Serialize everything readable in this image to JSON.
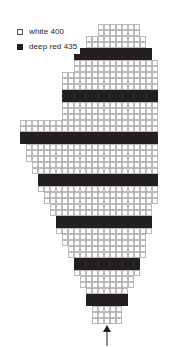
{
  "legend": {
    "items": [
      {
        "swatch": "white-swatch-icon",
        "label": "white 400",
        "color": "#ffffff",
        "kind": "white"
      },
      {
        "swatch": "deep-red-swatch-icon",
        "label": "deep red 435",
        "color": "#231f20",
        "kind": "red"
      }
    ]
  },
  "chart_data": {
    "type": "heatmap",
    "title": "",
    "xlabel": "",
    "ylabel": "",
    "grid": true,
    "legend_position": "top-left",
    "cell_size": 6,
    "origin": {
      "x": 20,
      "y": 24
    },
    "colors": {
      "white": "#ffffff",
      "red": "#231f20",
      "gridline": "#b9b9b9"
    },
    "categories": [
      "white 400",
      "deep red 435"
    ],
    "values": [
      3,
      11
    ],
    "rows": [
      {
        "index": 1,
        "start": 13,
        "count": 7,
        "color": "white"
      },
      {
        "index": 2,
        "start": 13,
        "count": 7,
        "color": "white"
      },
      {
        "index": 3,
        "start": 11,
        "count": 10,
        "color": "white"
      },
      {
        "index": 4,
        "start": 11,
        "count": 10,
        "color": "white"
      },
      {
        "index": 5,
        "start": 10,
        "count": 12,
        "color": "red"
      },
      {
        "index": 6,
        "start": 9,
        "count": 13,
        "color": "red"
      },
      {
        "index": 7,
        "start": 9,
        "count": 14,
        "color": "white"
      },
      {
        "index": 8,
        "start": 9,
        "count": 14,
        "color": "white"
      },
      {
        "index": 9,
        "start": 7,
        "count": 16,
        "color": "white"
      },
      {
        "index": 10,
        "start": 7,
        "count": 16,
        "color": "white"
      },
      {
        "index": 11,
        "start": 7,
        "count": 16,
        "color": "white"
      },
      {
        "index": 12,
        "start": 7,
        "count": 16,
        "color": "red"
      },
      {
        "index": 13,
        "start": 7,
        "count": 16,
        "color": "red"
      },
      {
        "index": 14,
        "start": 7,
        "count": 16,
        "color": "white"
      },
      {
        "index": 15,
        "start": 7,
        "count": 16,
        "color": "white"
      },
      {
        "index": 16,
        "start": 7,
        "count": 16,
        "color": "white"
      },
      {
        "index": 17,
        "start": 0,
        "count": 23,
        "color": "white"
      },
      {
        "index": 18,
        "start": 0,
        "count": 23,
        "color": "white"
      },
      {
        "index": 19,
        "start": 0,
        "count": 23,
        "color": "red"
      },
      {
        "index": 20,
        "start": 0,
        "count": 23,
        "color": "red"
      },
      {
        "index": 21,
        "start": 1,
        "count": 22,
        "color": "white"
      },
      {
        "index": 22,
        "start": 1,
        "count": 22,
        "color": "white"
      },
      {
        "index": 23,
        "start": 1,
        "count": 22,
        "color": "white"
      },
      {
        "index": 24,
        "start": 2,
        "count": 21,
        "color": "white"
      },
      {
        "index": 25,
        "start": 2,
        "count": 21,
        "color": "white"
      },
      {
        "index": 26,
        "start": 3,
        "count": 20,
        "color": "red"
      },
      {
        "index": 27,
        "start": 3,
        "count": 20,
        "color": "red"
      },
      {
        "index": 28,
        "start": 3,
        "count": 20,
        "color": "white"
      },
      {
        "index": 29,
        "start": 4,
        "count": 19,
        "color": "white"
      },
      {
        "index": 30,
        "start": 4,
        "count": 19,
        "color": "white"
      },
      {
        "index": 31,
        "start": 5,
        "count": 17,
        "color": "white"
      },
      {
        "index": 32,
        "start": 5,
        "count": 17,
        "color": "white"
      },
      {
        "index": 33,
        "start": 6,
        "count": 16,
        "color": "red"
      },
      {
        "index": 34,
        "start": 6,
        "count": 16,
        "color": "red"
      },
      {
        "index": 35,
        "start": 6,
        "count": 16,
        "color": "white"
      },
      {
        "index": 36,
        "start": 7,
        "count": 14,
        "color": "white"
      },
      {
        "index": 37,
        "start": 7,
        "count": 14,
        "color": "white"
      },
      {
        "index": 38,
        "start": 8,
        "count": 13,
        "color": "white"
      },
      {
        "index": 39,
        "start": 8,
        "count": 13,
        "color": "white"
      },
      {
        "index": 40,
        "start": 9,
        "count": 11,
        "color": "red"
      },
      {
        "index": 41,
        "start": 9,
        "count": 11,
        "color": "red"
      },
      {
        "index": 42,
        "start": 9,
        "count": 11,
        "color": "white"
      },
      {
        "index": 43,
        "start": 10,
        "count": 9,
        "color": "white"
      },
      {
        "index": 44,
        "start": 10,
        "count": 9,
        "color": "white"
      },
      {
        "index": 45,
        "start": 11,
        "count": 7,
        "color": "white"
      },
      {
        "index": 46,
        "start": 11,
        "count": 7,
        "color": "red"
      },
      {
        "index": 47,
        "start": 11,
        "count": 7,
        "color": "red"
      },
      {
        "index": 48,
        "start": 12,
        "count": 5,
        "color": "white"
      },
      {
        "index": 49,
        "start": 12,
        "count": 5,
        "color": "white"
      },
      {
        "index": 50,
        "start": 12,
        "count": 5,
        "color": "white"
      }
    ]
  },
  "marker": {
    "name": "start-arrow",
    "label": "",
    "direction": "up",
    "column": 14,
    "color": "#231f20"
  }
}
